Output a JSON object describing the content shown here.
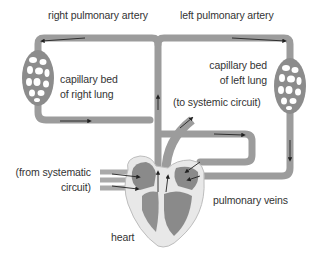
{
  "diagram": {
    "type": "pulmonary-circulation",
    "labels": {
      "right_pulmonary_artery": "right pulmonary artery",
      "left_pulmonary_artery": "left pulmonary artery",
      "capillary_right_line1": "capillary bed",
      "capillary_right_line2": "of right lung",
      "capillary_left_line1": "capillary bed",
      "capillary_left_line2": "of left lung",
      "to_systemic": "(to systemic circuit)",
      "from_systematic_line1": "(from systematic",
      "from_systematic_line2": "circuit)",
      "pulmonary_veins": "pulmonary veins",
      "heart": "heart"
    },
    "colors": {
      "vessel": "#9a9a9a",
      "vessel_edge": "#7a7a7a",
      "capillary": "#8c8c8c",
      "heart_outer": "#e6e6e6",
      "heart_inner": "#8a8a8a",
      "arrow": "#222222",
      "text": "#333333"
    }
  }
}
